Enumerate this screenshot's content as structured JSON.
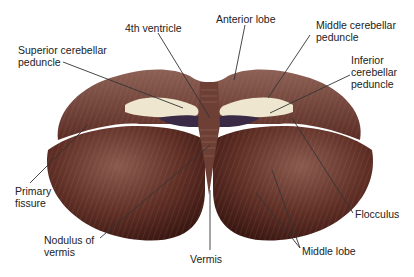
{
  "colors": {
    "tissue": "#5a2a22",
    "tissue_light": "#8a5548",
    "peduncle": "#efe6cf",
    "ventricle": "#3a2a45",
    "line": "#333333"
  },
  "labels": {
    "fourth_ventricle": "4th ventricle",
    "anterior_lobe": "Anterior lobe",
    "superior_peduncle": "Superior cerebellar\npeduncle",
    "middle_peduncle": "Middle cerebellar\npeduncle",
    "inferior_peduncle": "Inferior\ncerebellar\npeduncle",
    "primary_fissure": "Primary\nfissure",
    "nodulus": "Nodulus of\nvermis",
    "vermis": "Vermis",
    "flocculus": "Flocculus",
    "middle_lobe": "Middle lobe"
  }
}
